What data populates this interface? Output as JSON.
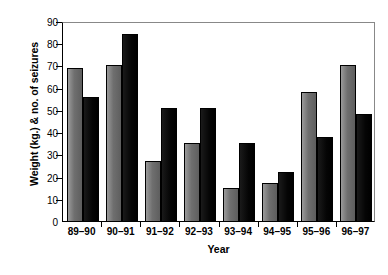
{
  "chart_data": {
    "type": "bar",
    "title": "",
    "xlabel": "Year",
    "ylabel": "Weight (kg.) & no. of seizures",
    "categories": [
      "89–90",
      "90–91",
      "91–92",
      "92–93",
      "93–94",
      "94–95",
      "95–96",
      "96–97"
    ],
    "series": [
      {
        "name": "Weight (kg.)",
        "color": "#6f6f6f",
        "values": [
          69,
          70,
          27,
          35,
          15,
          17,
          58,
          70
        ]
      },
      {
        "name": "No. of seizures",
        "color": "#000000",
        "values": [
          56,
          84,
          51,
          51,
          35,
          22,
          38,
          48
        ]
      }
    ],
    "ylim": [
      0,
      90
    ],
    "yticks": [
      0,
      10,
      20,
      30,
      40,
      50,
      60,
      70,
      80,
      90
    ],
    "ytick_labels": [
      "0",
      "10",
      "20",
      "30",
      "40",
      "50",
      "60",
      "70",
      "80",
      "90"
    ],
    "grid": false,
    "legend": "none",
    "frame": "full-box"
  }
}
